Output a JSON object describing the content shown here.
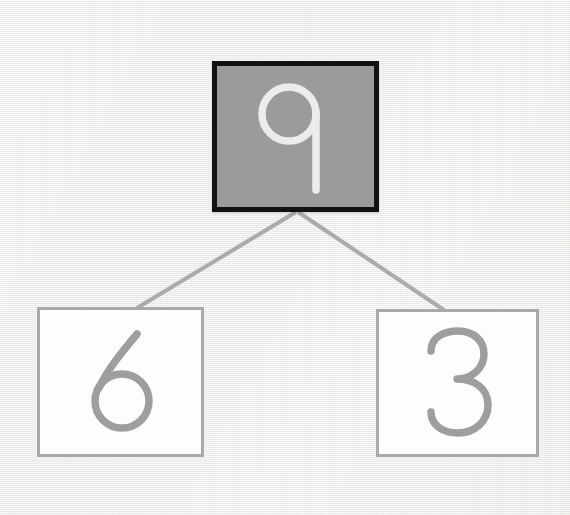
{
  "diagram": {
    "type": "number-bond",
    "whole": {
      "label": "9",
      "value": 9,
      "role": "whole",
      "fill_color": "#9b9b9b",
      "border_color": "#121212",
      "text_color": "#ececec",
      "highlighted": true
    },
    "parts": [
      {
        "label": "6",
        "value": 6,
        "role": "part",
        "position": "left",
        "fill_color": "#fdfdfd",
        "border_color": "#a9a9a9",
        "text_color": "#9e9e9e",
        "highlighted": false
      },
      {
        "label": "3",
        "value": 3,
        "role": "part",
        "position": "right",
        "fill_color": "#fdfdfd",
        "border_color": "#a9a9a9",
        "text_color": "#9e9e9e",
        "highlighted": false
      }
    ],
    "connectors": [
      {
        "name": "whole-to-left-part",
        "from": [
          296,
          212
        ],
        "to": [
          137,
          308
        ],
        "color": "#ababab",
        "width": 4
      },
      {
        "name": "whole-to-right-part",
        "from": [
          298,
          212
        ],
        "to": [
          444,
          310
        ],
        "color": "#ababab",
        "width": 4
      }
    ],
    "background_color": "#f1f1f0"
  }
}
